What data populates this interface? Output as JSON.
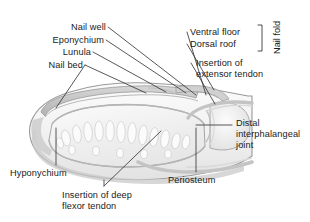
{
  "figure": {
    "type": "anatomical-illustration",
    "background_color": "#ffffff",
    "line_color": "#3a3a3a",
    "text_color": "#1a1a1a",
    "tissue_fill": "#f2f2f2",
    "bone_fill": "#ededed",
    "shadow_color": "#bdbdbd"
  },
  "labels": {
    "nail_well": "Nail well",
    "eponychium": "Eponychium",
    "lunula": "Lunula",
    "nail_bed": "Nail bed",
    "ventral_floor": "Ventral floor",
    "dorsal_roof": "Dorsal roof",
    "nail_fold": "Nail fold",
    "insertion_extensor_l1": "Insertion of",
    "insertion_extensor_l2": "extensor tendon",
    "distal_l1": "Distal",
    "distal_l2": "interphalangeal",
    "distal_l3": "joint",
    "periosteum": "Periosteum",
    "insertion_flexor_l1": "Insertion of deep",
    "insertion_flexor_l2": "flexor tendon",
    "hyponychium": "Hyponychium"
  }
}
